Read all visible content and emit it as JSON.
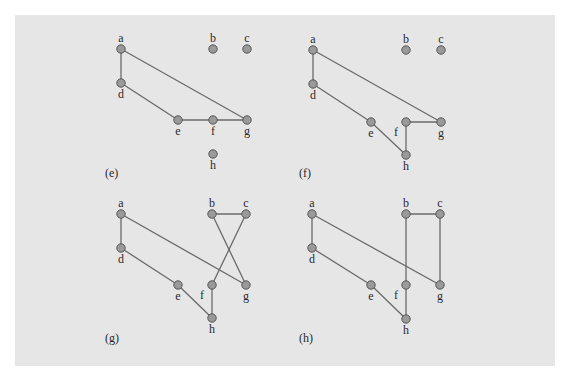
{
  "figure": {
    "colors": {
      "background": "#e6e6e6",
      "node_fill": "#9a9a9a",
      "node_stroke": "#555555",
      "edge": "#6a6a6a",
      "text": "#2a2a2a"
    },
    "panels": [
      {
        "id": "e",
        "label": "(e)",
        "label_pos": [
          105,
          177
        ],
        "nodes": {
          "a": [
            121,
            49
          ],
          "b": [
            213,
            49
          ],
          "c": [
            247,
            49
          ],
          "d": [
            121,
            83
          ],
          "e": [
            178,
            120
          ],
          "f": [
            213,
            120
          ],
          "g": [
            247,
            120
          ],
          "h": [
            213,
            154
          ]
        },
        "edges": [
          [
            "a",
            "d"
          ],
          [
            "a",
            "g"
          ],
          [
            "d",
            "e"
          ],
          [
            "e",
            "f"
          ],
          [
            "f",
            "g"
          ]
        ]
      },
      {
        "id": "f",
        "label": "(f)",
        "label_pos": [
          299,
          177
        ],
        "nodes": {
          "a": [
            313,
            50
          ],
          "b": [
            406,
            50
          ],
          "c": [
            441,
            50
          ],
          "d": [
            313,
            84
          ],
          "e": [
            371,
            122
          ],
          "f": [
            406,
            122
          ],
          "g": [
            441,
            122
          ],
          "h": [
            406,
            155
          ]
        },
        "edges": [
          [
            "a",
            "d"
          ],
          [
            "a",
            "g"
          ],
          [
            "d",
            "e"
          ],
          [
            "e",
            "h"
          ],
          [
            "h",
            "f"
          ],
          [
            "f",
            "g"
          ]
        ]
      },
      {
        "id": "g",
        "label": "(g)",
        "label_pos": [
          105,
          342
        ],
        "nodes": {
          "a": [
            121,
            214
          ],
          "b": [
            212,
            214
          ],
          "c": [
            246,
            214
          ],
          "d": [
            121,
            248
          ],
          "e": [
            178,
            285
          ],
          "f": [
            212,
            285
          ],
          "g": [
            246,
            285
          ],
          "h": [
            212,
            318
          ]
        },
        "edges": [
          [
            "a",
            "d"
          ],
          [
            "a",
            "g"
          ],
          [
            "d",
            "e"
          ],
          [
            "e",
            "h"
          ],
          [
            "h",
            "f"
          ],
          [
            "f",
            "c"
          ],
          [
            "c",
            "b"
          ],
          [
            "b",
            "g"
          ]
        ]
      },
      {
        "id": "h",
        "label": "(h)",
        "label_pos": [
          299,
          342
        ],
        "nodes": {
          "a": [
            312,
            214
          ],
          "b": [
            406,
            214
          ],
          "c": [
            440,
            214
          ],
          "d": [
            312,
            248
          ],
          "e": [
            371,
            285
          ],
          "f": [
            406,
            285
          ],
          "g": [
            440,
            285
          ],
          "h": [
            406,
            319
          ]
        },
        "edges": [
          [
            "a",
            "d"
          ],
          [
            "a",
            "g"
          ],
          [
            "d",
            "e"
          ],
          [
            "e",
            "h"
          ],
          [
            "h",
            "f"
          ],
          [
            "f",
            "b"
          ],
          [
            "b",
            "c"
          ],
          [
            "c",
            "g"
          ]
        ]
      }
    ],
    "node_label_placement": {
      "a": "above",
      "b": "above",
      "c": "above",
      "d": "below",
      "e": "below",
      "g": "below",
      "h": "below",
      "f": "below"
    },
    "f_label_left_in_panels": [
      "f",
      "g",
      "h"
    ]
  }
}
